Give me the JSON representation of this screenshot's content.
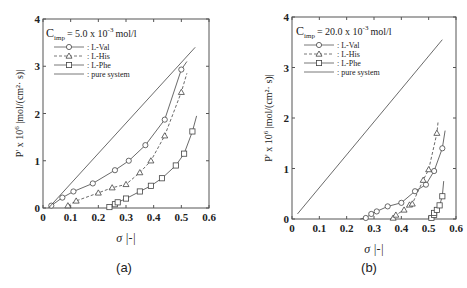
{
  "chart_data": [
    {
      "type": "scatter",
      "panel": "(a)",
      "annotation": {
        "prefix": "C",
        "sub": "imp",
        "text": "= 5.0 x 10",
        "sup": "-3",
        "unit": "mol/l"
      },
      "xlabel": "σ  |-|",
      "ylabel": "P' x 10",
      "ylabel_sup": "6",
      "ylabel_unit": "|mol/(cm²· s)|",
      "xlim": [
        0,
        0.6
      ],
      "ylim": [
        0,
        4
      ],
      "xticks": [
        "0",
        "0.1",
        "0.2",
        "0.3",
        "0.4",
        "0.5",
        "0.6"
      ],
      "yticks": [
        "0",
        "1",
        "2",
        "3",
        "4"
      ],
      "legend": [
        ": L-Val",
        ": L-His",
        ": L-Phe",
        ": pure system"
      ],
      "series": [
        {
          "name": "L-Val",
          "marker": "circle",
          "line": "solid",
          "x": [
            0.03,
            0.07,
            0.11,
            0.18,
            0.26,
            0.31,
            0.37,
            0.44,
            0.5
          ],
          "y": [
            0.05,
            0.22,
            0.35,
            0.52,
            0.8,
            1.0,
            1.33,
            1.87,
            2.93
          ],
          "curve_end": [
            0.52,
            3.1
          ]
        },
        {
          "name": "L-His",
          "marker": "triangle",
          "line": "dashed",
          "x": [
            0.09,
            0.12,
            0.2,
            0.25,
            0.3,
            0.35,
            0.39,
            0.44,
            0.5
          ],
          "y": [
            0.05,
            0.15,
            0.32,
            0.43,
            0.5,
            0.75,
            1.0,
            1.53,
            2.45
          ],
          "curve_end": [
            0.52,
            2.85
          ]
        },
        {
          "name": "L-Phe",
          "marker": "square",
          "line": "solid",
          "x": [
            0.24,
            0.26,
            0.27,
            0.3,
            0.35,
            0.39,
            0.43,
            0.48,
            0.51,
            0.54
          ],
          "y": [
            0.02,
            0.08,
            0.12,
            0.2,
            0.35,
            0.47,
            0.63,
            0.9,
            1.15,
            1.62
          ],
          "curve_end": [
            0.555,
            1.95
          ]
        },
        {
          "name": "pure system",
          "marker": "none",
          "line": "solid",
          "x": [
            0.02,
            0.55
          ],
          "y": [
            0.0,
            3.4
          ]
        }
      ]
    },
    {
      "type": "scatter",
      "panel": "(b)",
      "annotation": {
        "prefix": "C",
        "sub": "imp",
        "text": "= 20.0 x 10",
        "sup": "-3",
        "unit": "mol/l"
      },
      "xlabel": "σ  |-|",
      "ylabel": "P' x 10",
      "ylabel_sup": "6",
      "ylabel_unit": "|mol/(cm²· s)|",
      "xlim": [
        0,
        0.6
      ],
      "ylim": [
        0,
        4
      ],
      "xticks": [
        "0",
        "0.1",
        "0.2",
        "0.3",
        "0.4",
        "0.5",
        "0.6"
      ],
      "yticks": [
        "0",
        "1",
        "2",
        "3",
        "4"
      ],
      "legend": [
        ": L-Val",
        ": L-His",
        ": L-Phe",
        ": pure system"
      ],
      "series": [
        {
          "name": "L-Val",
          "marker": "circle",
          "line": "solid",
          "x": [
            0.27,
            0.29,
            0.31,
            0.35,
            0.4,
            0.45,
            0.49,
            0.52,
            0.55
          ],
          "y": [
            0.02,
            0.1,
            0.15,
            0.25,
            0.32,
            0.55,
            0.68,
            0.95,
            1.4
          ],
          "curve_start": [
            0.25,
            0.0
          ],
          "curve_end": [
            0.56,
            1.75
          ]
        },
        {
          "name": "L-His",
          "marker": "triangle",
          "line": "dashed",
          "x": [
            0.37,
            0.38,
            0.41,
            0.43,
            0.44,
            0.48,
            0.5,
            0.53
          ],
          "y": [
            0.02,
            0.08,
            0.18,
            0.28,
            0.3,
            0.77,
            0.98,
            1.7
          ],
          "curve_start": [
            0.36,
            0.0
          ],
          "curve_end": [
            0.535,
            1.95
          ]
        },
        {
          "name": "L-Phe",
          "marker": "square",
          "line": "solid",
          "x": [
            0.51,
            0.52,
            0.52,
            0.53,
            0.54,
            0.55
          ],
          "y": [
            0.02,
            0.08,
            0.12,
            0.18,
            0.27,
            0.45
          ],
          "curve_start": [
            0.505,
            0.0
          ],
          "curve_end": [
            0.555,
            0.75
          ]
        },
        {
          "name": "pure system",
          "marker": "none",
          "line": "solid",
          "x": [
            0.02,
            0.55
          ],
          "y": [
            0.1,
            3.55
          ]
        }
      ]
    }
  ],
  "captions": [
    "(a)",
    "(b)"
  ]
}
